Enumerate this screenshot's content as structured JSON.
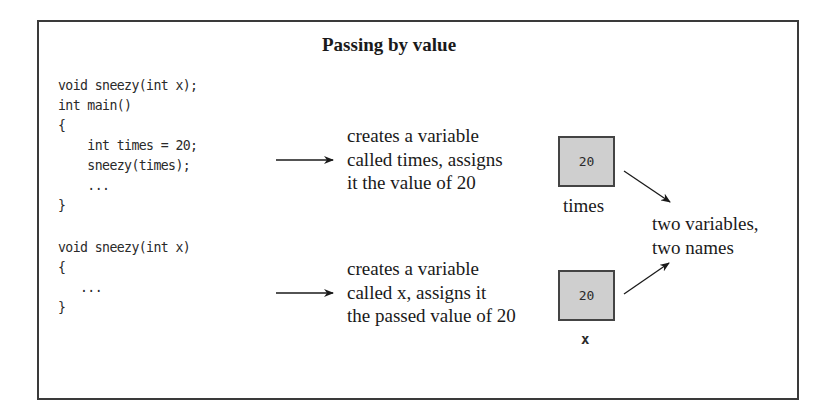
{
  "figure": {
    "title": "Passing by value",
    "code_block_1": {
      "lines": [
        "void sneezy(int x);",
        "int main()",
        "{",
        "    int times = 20;",
        "    sneezy(times);",
        "    ...",
        "}"
      ]
    },
    "code_block_2": {
      "lines": [
        "void sneezy(int x)",
        "{",
        "   ...",
        "}"
      ]
    },
    "annotation_1": {
      "lines": [
        "creates a variable",
        "called times, assigns",
        "it the value of 20"
      ]
    },
    "annotation_2": {
      "lines": [
        "creates a variable",
        "called x, assigns it",
        "the passed value of 20"
      ]
    },
    "variable_boxes": [
      {
        "value": "20",
        "name": "times"
      },
      {
        "value": "20",
        "name": "x"
      }
    ],
    "summary": {
      "lines": [
        "two variables,",
        "two names"
      ]
    },
    "colors": {
      "box_fill": "#cfcfcf",
      "border": "#3a3a3a"
    }
  }
}
